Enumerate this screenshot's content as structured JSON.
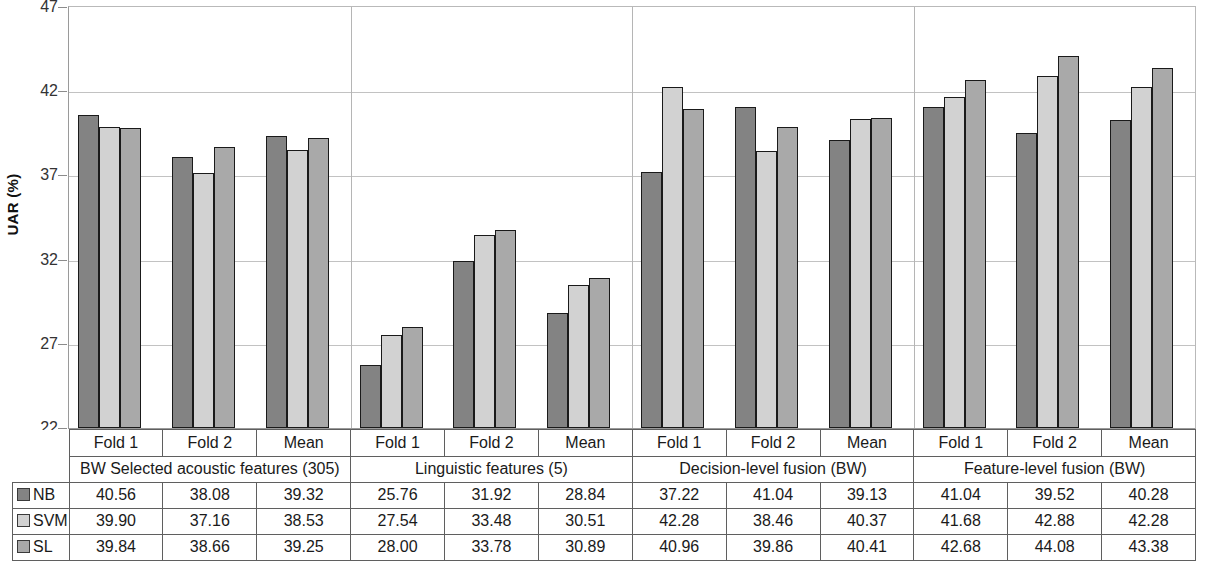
{
  "chart_data": {
    "type": "bar",
    "title": "",
    "xlabel": "",
    "ylabel": "UAR (%)",
    "ylim": [
      22,
      47
    ],
    "yticks": [
      22,
      27,
      32,
      37,
      42,
      47
    ],
    "grid": true,
    "legend_position": "table-left-column",
    "categories": [
      "BW Selected acoustic features (305) / Fold 1",
      "BW Selected acoustic features (305) / Fold 2",
      "BW Selected acoustic features (305) / Mean",
      "Linguistic features (5) / Fold 1",
      "Linguistic features (5) / Fold 2",
      "Linguistic features (5) / Mean",
      "Decision-level fusion (BW) / Fold 1",
      "Decision-level fusion (BW) / Fold 2",
      "Decision-level fusion (BW) / Mean",
      "Feature-level fusion (BW) / Fold 1",
      "Feature-level fusion (BW) / Fold 2",
      "Feature-level fusion (BW) / Mean"
    ],
    "series": [
      {
        "name": "NB",
        "color": "#838383",
        "values": [
          40.56,
          38.08,
          39.32,
          25.76,
          31.92,
          28.84,
          37.22,
          41.04,
          39.13,
          41.04,
          39.52,
          40.28
        ]
      },
      {
        "name": "SVM",
        "color": "#d2d2d2",
        "values": [
          39.9,
          37.16,
          38.53,
          27.54,
          33.48,
          30.51,
          42.28,
          38.46,
          40.37,
          41.68,
          42.88,
          42.28
        ]
      },
      {
        "name": "SL",
        "color": "#a9a9a9",
        "values": [
          39.84,
          38.66,
          39.25,
          28.0,
          33.78,
          30.89,
          40.96,
          39.86,
          40.41,
          42.68,
          44.08,
          43.38
        ]
      }
    ]
  },
  "axis": {
    "y_title": "UAR (%)",
    "y_ticks": [
      "47",
      "42",
      "37",
      "32",
      "27",
      "22"
    ]
  },
  "groups": [
    {
      "name": "BW Selected acoustic features (305)",
      "folds": [
        "Fold 1",
        "Fold 2",
        "Mean"
      ]
    },
    {
      "name": "Linguistic features (5)",
      "folds": [
        "Fold 1",
        "Fold 2",
        "Mean"
      ]
    },
    {
      "name": "Decision-level fusion (BW)",
      "folds": [
        "Fold 1",
        "Fold 2",
        "Mean"
      ]
    },
    {
      "name": "Feature-level fusion (BW)",
      "folds": [
        "Fold 1",
        "Fold 2",
        "Mean"
      ]
    }
  ],
  "table": {
    "rows": [
      {
        "label": "NB",
        "swatch": "nb",
        "values": [
          "40.56",
          "38.08",
          "39.32",
          "25.76",
          "31.92",
          "28.84",
          "37.22",
          "41.04",
          "39.13",
          "41.04",
          "39.52",
          "40.28"
        ]
      },
      {
        "label": "SVM",
        "swatch": "svm",
        "values": [
          "39.90",
          "37.16",
          "38.53",
          "27.54",
          "33.48",
          "30.51",
          "42.28",
          "38.46",
          "40.37",
          "41.68",
          "42.88",
          "42.28"
        ]
      },
      {
        "label": "SL",
        "swatch": "sl",
        "values": [
          "39.84",
          "38.66",
          "39.25",
          "28.00",
          "33.78",
          "30.89",
          "40.96",
          "39.86",
          "40.41",
          "42.68",
          "44.08",
          "43.38"
        ]
      }
    ]
  }
}
